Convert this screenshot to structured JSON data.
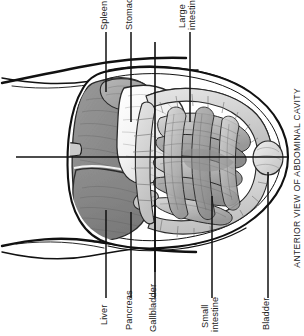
{
  "figure": {
    "caption": "ANTERIOR VIEW OF ABDOMINAL CAVITY",
    "background_color": "#ffffff",
    "ink_color": "#1c1c1c",
    "organ_fill_dark": "#8a8a8a",
    "organ_fill_mid": "#a8a8a8",
    "organ_fill_light": "#d8d8d8",
    "organ_fill_white": "#f4f4f4",
    "orientation": "labels rotated 90 degrees counter-clockwise"
  },
  "labels": {
    "top": [
      {
        "id": "spleen",
        "text": "Spleen"
      },
      {
        "id": "stomach",
        "text": "Stomach"
      },
      {
        "id": "large-intestine",
        "text": "Large\nintestine"
      }
    ],
    "bottom": [
      {
        "id": "liver",
        "text": "Liver"
      },
      {
        "id": "pancreas",
        "text": "Pancreas"
      },
      {
        "id": "gallbladder",
        "text": "Gallbladder"
      },
      {
        "id": "small-intestine",
        "text": "Small\nintestine"
      },
      {
        "id": "bladder",
        "text": "Bladder"
      }
    ]
  },
  "organs": [
    {
      "id": "liver",
      "name": "Liver"
    },
    {
      "id": "spleen",
      "name": "Spleen"
    },
    {
      "id": "stomach",
      "name": "Stomach"
    },
    {
      "id": "pancreas",
      "name": "Pancreas"
    },
    {
      "id": "gallbladder",
      "name": "Gallbladder"
    },
    {
      "id": "small-intestine",
      "name": "Small intestine"
    },
    {
      "id": "large-intestine",
      "name": "Large intestine"
    },
    {
      "id": "bladder",
      "name": "Bladder"
    }
  ]
}
